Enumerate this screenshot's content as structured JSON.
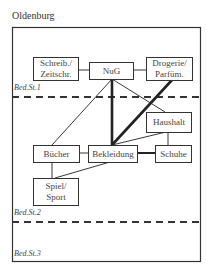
{
  "title": "Oldenburg",
  "zones": [
    {
      "label": "Bed.St.1"
    },
    {
      "label": "Bed.St.2"
    },
    {
      "label": "Bed.St.3"
    }
  ],
  "nodes": {
    "schreib": "Schreib./\nZeitschr.",
    "nug": "NuG",
    "drogerie": "Drogerie/\nParfüm.",
    "haushalt": "Haushalt",
    "buecher": "Bücher",
    "bekleidung": "Bekleidung",
    "schuhe": "Schuhe",
    "spiel": "Spiel/\nSport"
  },
  "edges": [
    {
      "from": "Schreib./Zeitschr.",
      "to": "NuG",
      "weight": "thin"
    },
    {
      "from": "NuG",
      "to": "Drogerie/Parfüm.",
      "weight": "thin"
    },
    {
      "from": "NuG",
      "to": "Bücher",
      "weight": "thin"
    },
    {
      "from": "NuG",
      "to": "Bekleidung",
      "weight": "thick"
    },
    {
      "from": "NuG",
      "to": "Haushalt",
      "weight": "thin"
    },
    {
      "from": "Drogerie/Parfüm.",
      "to": "Bekleidung",
      "weight": "thick"
    },
    {
      "from": "Haushalt",
      "to": "Bekleidung",
      "weight": "thin"
    },
    {
      "from": "Haushalt",
      "to": "Schuhe",
      "weight": "thin"
    },
    {
      "from": "Bücher",
      "to": "Bekleidung",
      "weight": "thin"
    },
    {
      "from": "Bekleidung",
      "to": "Schuhe",
      "weight": "medium"
    },
    {
      "from": "Bücher",
      "to": "Spiel/Sport",
      "weight": "thin"
    },
    {
      "from": "Bekleidung",
      "to": "Spiel/Sport",
      "weight": "thin"
    }
  ]
}
